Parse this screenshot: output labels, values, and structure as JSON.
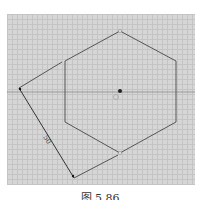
{
  "figure": {
    "caption": "图 5.86",
    "dimension_label": "50",
    "shape": "hexagon",
    "colors": {
      "background": "#d6d6d6",
      "grid": "#c4c4c4",
      "line": "#555555"
    }
  }
}
